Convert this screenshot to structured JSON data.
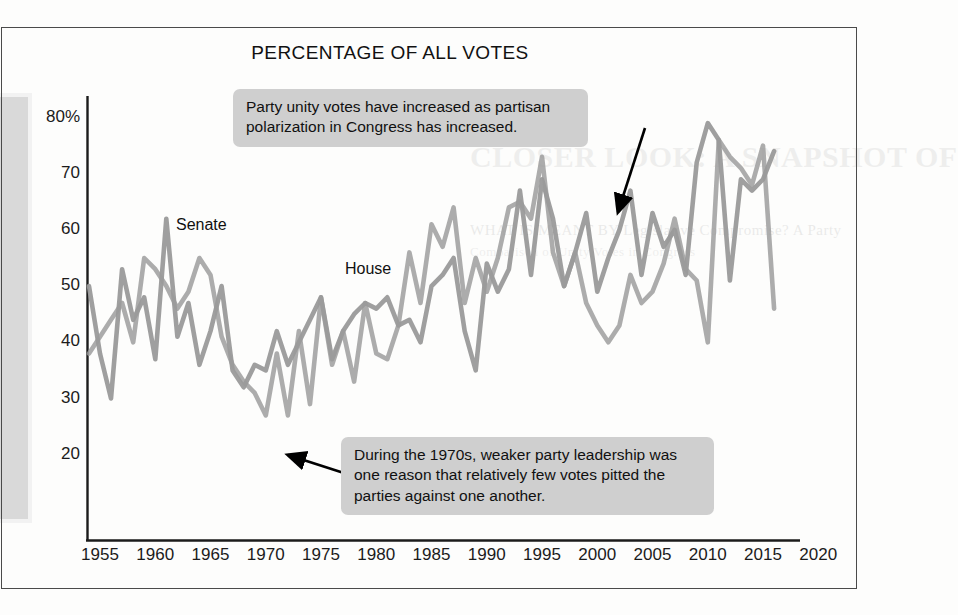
{
  "figure": {
    "title": "PERCENTAGE OF ALL VOTES",
    "frame_color": "#4a4a4a",
    "line_color": "#9a9a9a",
    "callout_bg": "#cfcfcf"
  },
  "ghost_text": {
    "heading": "CLOSER LOOK: A SNAPSHOT OF",
    "sub": "WHAT IS MEANT BY Legislative Compromise? A Party",
    "sub2": "Comparison of Unity Votes in Congress"
  },
  "series_labels": {
    "senate": "Senate",
    "house": "House"
  },
  "callouts": [
    {
      "name": "party-unity-increase",
      "text": "Party unity votes have increased as partisan polarization in Congress has increased."
    },
    {
      "name": "weak-party-leadership-1970s",
      "text": "During the 1970s, weaker party leadership was one reason that relatively few votes pitted the parties against one another."
    }
  ],
  "chart_data": {
    "type": "line",
    "title": "PERCENTAGE OF ALL VOTES",
    "xlabel": "",
    "ylabel": "",
    "xlim": [
      1951.5,
      2021.5
    ],
    "ylim": [
      14,
      84
    ],
    "grid": false,
    "legend": "inline-series-labels",
    "ytick_labels": [
      "80%",
      "70",
      "60",
      "50",
      "40",
      "30",
      "20"
    ],
    "ytick_values": [
      80,
      70,
      60,
      50,
      40,
      30,
      20
    ],
    "xtick_labels": [
      "1955",
      "1960",
      "1965",
      "1970",
      "1975",
      "1980",
      "1985",
      "1990",
      "1995",
      "2000",
      "2005",
      "2010",
      "2015",
      "2020"
    ],
    "xtick_values": [
      1955,
      1960,
      1965,
      1970,
      1975,
      1980,
      1985,
      1990,
      1995,
      2000,
      2005,
      2010,
      2015,
      2020
    ],
    "x": [
      1954,
      1955,
      1956,
      1957,
      1958,
      1959,
      1960,
      1961,
      1962,
      1963,
      1964,
      1965,
      1966,
      1967,
      1968,
      1969,
      1970,
      1971,
      1972,
      1973,
      1974,
      1975,
      1976,
      1977,
      1978,
      1979,
      1980,
      1981,
      1982,
      1983,
      1984,
      1985,
      1986,
      1987,
      1988,
      1989,
      1990,
      1991,
      1992,
      1993,
      1994,
      1995,
      1996,
      1997,
      1998,
      1999,
      2000,
      2001,
      2002,
      2003,
      2004,
      2005,
      2006,
      2007,
      2008,
      2009,
      2010,
      2011,
      2012,
      2013,
      2014,
      2015,
      2016
    ],
    "series": [
      {
        "name": "Senate",
        "values": [
          50,
          38,
          30,
          53,
          44,
          48,
          37,
          62,
          41,
          47,
          36,
          42,
          50,
          35,
          32,
          36,
          35,
          42,
          36,
          40,
          44,
          48,
          37,
          42,
          45,
          47,
          46,
          48,
          43,
          44,
          40,
          50,
          52,
          55,
          42,
          35,
          54,
          49,
          53,
          67,
          52,
          69,
          62,
          50,
          56,
          63,
          49,
          55,
          60,
          67,
          52,
          63,
          57,
          60,
          52,
          72,
          79,
          76,
          51,
          69,
          67,
          69,
          74
        ],
        "color": "#9a9a9a"
      },
      {
        "name": "House",
        "values": [
          38,
          41,
          44,
          47,
          40,
          55,
          53,
          50,
          46,
          49,
          55,
          52,
          41,
          36,
          33,
          31,
          27,
          38,
          27,
          42,
          29,
          48,
          36,
          42,
          33,
          47,
          38,
          37,
          43,
          56,
          47,
          61,
          57,
          64,
          47,
          55,
          49,
          55,
          64,
          65,
          62,
          73,
          56,
          50,
          56,
          47,
          43,
          40,
          43,
          52,
          47,
          49,
          54,
          62,
          53,
          51,
          40,
          76,
          73,
          71,
          68,
          75,
          46
        ],
        "color": "#9a9a9a"
      }
    ]
  },
  "annotation_arrows": [
    {
      "name": "arrow-to-senate-2002",
      "from": [
        645,
        128
      ],
      "to": [
        618,
        212
      ]
    },
    {
      "name": "arrow-to-house-1972",
      "from": [
        347,
        474
      ],
      "to": [
        288,
        455
      ]
    }
  ]
}
